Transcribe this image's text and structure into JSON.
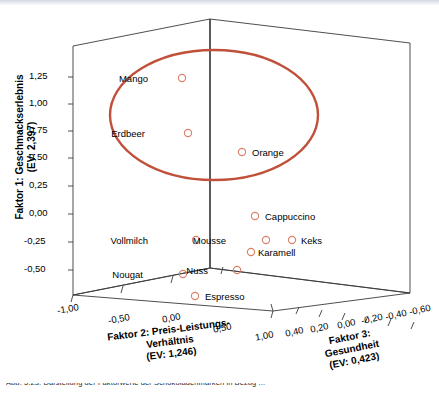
{
  "figure": {
    "kind": "spss-3d-scatter",
    "background": "#ffffff",
    "caption_partial": "Abb. 5.23:  Darstellung der  Faktorwerte der Schokoladenmarken  in Bezug ..."
  },
  "colors": {
    "marker_stroke": "#d9836c",
    "ellipse": "#c0503a",
    "axis": "#3a3a3a",
    "text": "#000000"
  },
  "axes": {
    "y": {
      "title_lines": [
        "Faktor 1: Geschmackserlebnis",
        "(EV: 2,397)"
      ],
      "ticks": [
        "1,25",
        "1,00",
        "0,75",
        "0,50",
        "0,25",
        "0,00",
        "-0,25",
        "-0,50"
      ]
    },
    "x": {
      "title_lines": [
        "Faktor 2: Preis-Leistungs-",
        "Verhältnis",
        "(EV: 1,246)"
      ],
      "ticks": [
        "-1,00",
        "-0,50",
        "0,00",
        "0,50",
        "1,00"
      ]
    },
    "z": {
      "title_lines": [
        "Faktor 3:",
        "Gesundheit",
        "(EV: 0,423)"
      ],
      "ticks": [
        "0,40",
        "0,20",
        "0,00",
        "-0,20",
        "-0,40",
        "-0,60"
      ]
    }
  },
  "annotation": {
    "ellipse_label": "cluster-highlight-ellipse"
  },
  "chart_data": {
    "type": "scatter",
    "title": "",
    "xlabel": "Faktor 2: Preis-Leistungs-Verhältnis (EV: 1,246)",
    "ylabel": "Faktor 1: Geschmackserlebnis (EV: 2,397)",
    "zlabel": "Faktor 3: Gesundheit (EV: 0,423)",
    "xlim": [
      -1.25,
      1.25
    ],
    "ylim": [
      -0.625,
      1.375
    ],
    "zlim": [
      -0.7,
      0.5
    ],
    "grid": false,
    "legend": "none",
    "points": [
      {
        "label": "Mango",
        "x": -0.3,
        "y": 1.22,
        "z": 0.05,
        "px": 182,
        "py": 78,
        "lx": 148,
        "ly": 73,
        "side": "left"
      },
      {
        "label": "Erdbeer",
        "x": -0.28,
        "y": 0.73,
        "z": 0.02,
        "px": 188,
        "py": 133,
        "lx": 145,
        "ly": 128,
        "side": "left"
      },
      {
        "label": "Orange",
        "x": 0.28,
        "y": 0.6,
        "z": 0.0,
        "px": 242,
        "py": 152,
        "lx": 252,
        "ly": 147,
        "side": "right"
      },
      {
        "label": "Cappuccino",
        "x": 0.42,
        "y": 0.05,
        "z": -0.2,
        "px": 255,
        "py": 216,
        "lx": 265,
        "ly": 211,
        "side": "right"
      },
      {
        "label": "Vollmilch",
        "x": -0.18,
        "y": -0.15,
        "z": 0.1,
        "px": 196,
        "py": 240,
        "lx": 148,
        "ly": 235,
        "side": "left"
      },
      {
        "label": "Mousse",
        "x": 0.3,
        "y": -0.15,
        "z": -0.22,
        "px": 266,
        "py": 240,
        "lx": 226,
        "ly": 235,
        "side": "left"
      },
      {
        "label": "Keks",
        "x": 0.52,
        "y": -0.15,
        "z": -0.38,
        "px": 292,
        "py": 240,
        "lx": 301,
        "ly": 235,
        "side": "right"
      },
      {
        "label": "Karamell",
        "x": 0.36,
        "y": -0.24,
        "z": -0.25,
        "px": 251,
        "py": 252,
        "lx": 258,
        "ly": 247,
        "side": "right"
      },
      {
        "label": "Nuss",
        "x": 0.22,
        "y": -0.42,
        "z": -0.05,
        "px": 237,
        "py": 270,
        "lx": 208,
        "ly": 265,
        "side": "left"
      },
      {
        "label": "Nougat",
        "x": -0.14,
        "y": -0.43,
        "z": 0.22,
        "px": 183,
        "py": 274,
        "lx": 143,
        "ly": 269,
        "side": "left"
      },
      {
        "label": "Espresso",
        "x": 0.05,
        "y": -0.56,
        "z": 0.16,
        "px": 195,
        "py": 296,
        "lx": 205,
        "ly": 291,
        "side": "right"
      }
    ],
    "ellipse_annotation": {
      "cx": 214,
      "cy": 115,
      "rx": 104,
      "ry": 65,
      "stroke": "#c0503a",
      "stroke_width": 2.4,
      "encloses": [
        "Mango",
        "Erdbeer",
        "Orange"
      ]
    }
  }
}
